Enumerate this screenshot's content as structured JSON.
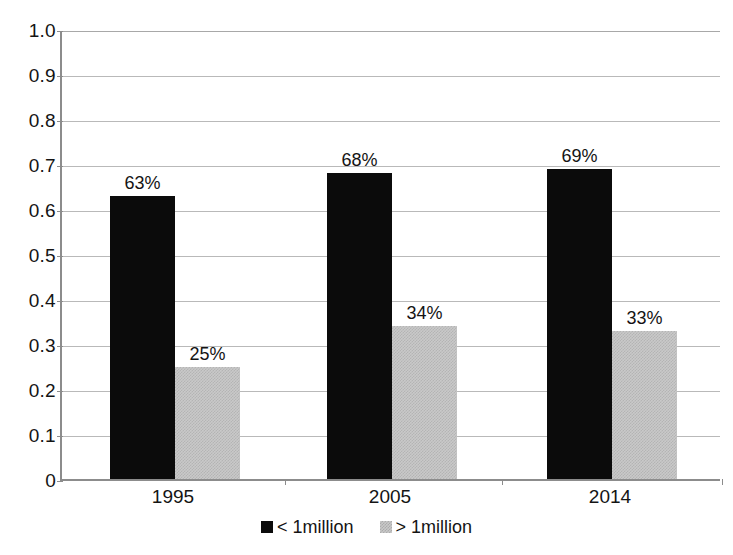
{
  "chart_data": {
    "type": "bar",
    "title": "",
    "subtitle": "",
    "xlabel": "",
    "ylabel": "",
    "categories": [
      "1995",
      "2005",
      "2014"
    ],
    "series": [
      {
        "name": "< 1million",
        "color": "#0b0b0b",
        "values": [
          0.63,
          0.68,
          0.69
        ],
        "data_labels": [
          "63%",
          "68%",
          "69%"
        ]
      },
      {
        "name": "> 1million",
        "color": "#c9c9c9",
        "values": [
          0.25,
          0.34,
          0.33
        ],
        "data_labels": [
          "25%",
          "34%",
          "33%"
        ]
      }
    ],
    "ylim": [
      0,
      1.0
    ],
    "ytick_values": [
      1.0,
      0.9,
      0.8,
      0.7,
      0.6,
      0.5,
      0.4,
      0.3,
      0.2,
      0.1,
      0
    ],
    "ytick_labels": [
      "1.0",
      "0.9",
      "0.8",
      "0.7",
      "0.6",
      "0.5",
      "0.4",
      "0.3",
      "0.2",
      "0.1",
      "0"
    ],
    "grid": true,
    "grid_axis": "y",
    "legend_position": "bottom-center"
  },
  "legend": {
    "items": [
      {
        "label": "< 1million",
        "swatch": "dark"
      },
      {
        "label": "> 1million",
        "swatch": "light"
      }
    ]
  }
}
